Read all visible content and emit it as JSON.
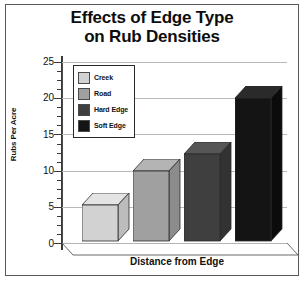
{
  "chart_data": {
    "type": "bar",
    "title": "Effects of Edge Type on Rub Densities",
    "title_lines": [
      "Effects of Edge Type",
      "on Rub Densities"
    ],
    "xlabel": "Distance from Edge",
    "ylabel": "Rubs Per Acre",
    "categories": [
      "Creek",
      "Road",
      "Hard Edge",
      "Soft Edge"
    ],
    "values": [
      5,
      9.6,
      12,
      19.7
    ],
    "ylim": [
      0,
      25
    ],
    "yticks": [
      0,
      5,
      10,
      15,
      20,
      25
    ],
    "ytick_labels": [
      "0",
      "5",
      "10",
      "15",
      "20",
      "25"
    ],
    "minor_ticks": true,
    "grid": true,
    "legend_position": "upper-left",
    "style": "3d-bar",
    "series": [
      {
        "name": "Rubs Per Acre",
        "values": [
          5,
          9.6,
          12,
          19.7
        ]
      }
    ],
    "legend_entries": [
      {
        "label": "Creek",
        "color": "#d2d2d2"
      },
      {
        "label": "Road",
        "color": "#a0a0a0"
      },
      {
        "label": "Hard Edge",
        "color": "#3f3f3f"
      },
      {
        "label": "Soft Edge",
        "color": "#141414"
      }
    ],
    "bar_colors": {
      "creek": {
        "front": "#d2d2d2",
        "top": "#e4e4e4",
        "side": "#bcbcbc"
      },
      "road": {
        "front": "#a0a0a0",
        "top": "#b4b4b4",
        "side": "#8c8c8c"
      },
      "hard_edge": {
        "front": "#3f3f3f",
        "top": "#565656",
        "side": "#323232"
      },
      "soft_edge": {
        "front": "#141414",
        "top": "#2a2a2a",
        "side": "#0b0b0b"
      }
    },
    "colors": {
      "background": "#ffffff",
      "text": "#101010",
      "axis": "#3a3a3a",
      "grid": "#b9b9b9",
      "frame": "#5a5a5a"
    }
  }
}
